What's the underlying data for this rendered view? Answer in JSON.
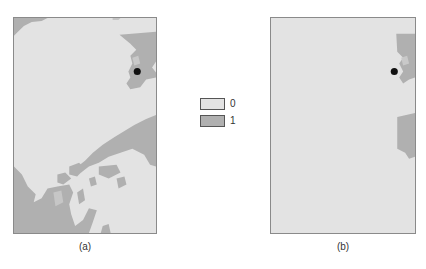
{
  "figure": {
    "panels": [
      {
        "id": "a",
        "caption": "(a)"
      },
      {
        "id": "b",
        "caption": "(b)"
      }
    ],
    "legend": {
      "items": [
        {
          "label": "0",
          "color": "#e3e3e3"
        },
        {
          "label": "1",
          "color": "#b0b0b0"
        }
      ]
    },
    "colors": {
      "class_0": "#e3e3e3",
      "class_1": "#b0b0b0",
      "marker": "#111111",
      "frame": "#8a8a8a"
    },
    "marker": {
      "shape": "filled-circle",
      "description": "location point"
    }
  }
}
